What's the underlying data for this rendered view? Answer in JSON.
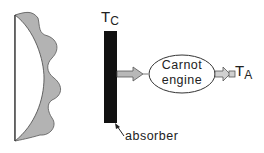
{
  "diagram": {
    "labels": {
      "absorber_temp_main": "T",
      "absorber_temp_sub": "C",
      "ambient_temp_main": "T",
      "ambient_temp_sub": "A",
      "engine_line1": "Carnot",
      "engine_line2": "engine",
      "absorber": "absorber"
    },
    "colors": {
      "background": "#ffffff",
      "concentrator_fill": "#b3b3b3",
      "absorber_fill": "#111111",
      "arrow_fill": "#b8b8b8",
      "stroke": "#333333"
    },
    "nodes": [
      {
        "id": "concentrator",
        "shape": "wavy lens/mirror"
      },
      {
        "id": "absorber",
        "shape": "black vertical bar",
        "label": "T_C"
      },
      {
        "id": "carnot-engine",
        "shape": "ellipse",
        "label": "Carnot engine"
      },
      {
        "id": "ambient",
        "shape": "text",
        "label": "T_A"
      }
    ],
    "edges": [
      {
        "from": "absorber",
        "to": "carnot-engine",
        "type": "block-arrow"
      },
      {
        "from": "carnot-engine",
        "to": "ambient",
        "type": "block-arrow"
      }
    ]
  }
}
